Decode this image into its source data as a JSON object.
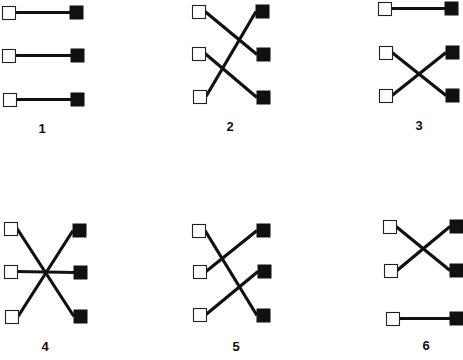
{
  "figure": {
    "colors": {
      "line": "#111111",
      "open_fill": "#ffffff",
      "filled_fill": "#111111",
      "background": "#ffffff"
    },
    "node_size": 13,
    "panels": [
      {
        "label": "1",
        "label_pos": [
          42,
          133
        ],
        "left": [
          [
            2,
            6
          ],
          [
            2,
            49
          ],
          [
            3,
            93
          ]
        ],
        "right": [
          [
            70,
            6
          ],
          [
            71,
            49
          ],
          [
            71,
            93
          ]
        ],
        "pairs": [
          [
            0,
            0
          ],
          [
            1,
            1
          ],
          [
            2,
            2
          ]
        ]
      },
      {
        "label": "2",
        "label_pos": [
          230,
          131
        ],
        "left": [
          [
            192,
            5
          ],
          [
            192,
            47
          ],
          [
            193,
            90
          ]
        ],
        "right": [
          [
            256,
            5
          ],
          [
            257,
            48
          ],
          [
            257,
            91
          ]
        ],
        "pairs": [
          [
            0,
            1
          ],
          [
            1,
            2
          ],
          [
            2,
            0
          ]
        ]
      },
      {
        "label": "3",
        "label_pos": [
          419,
          130
        ],
        "left": [
          [
            378,
            2
          ],
          [
            379,
            46
          ],
          [
            379,
            89
          ]
        ],
        "right": [
          [
            445,
            2
          ],
          [
            446,
            46
          ],
          [
            446,
            89
          ]
        ],
        "pairs": [
          [
            0,
            0
          ],
          [
            1,
            2
          ],
          [
            2,
            1
          ]
        ]
      },
      {
        "label": "4",
        "label_pos": [
          45,
          351
        ],
        "left": [
          [
            4,
            222
          ],
          [
            4,
            265
          ],
          [
            5,
            310
          ]
        ],
        "right": [
          [
            73,
            224
          ],
          [
            74,
            266
          ],
          [
            74,
            310
          ]
        ],
        "pairs": [
          [
            0,
            2
          ],
          [
            1,
            1
          ],
          [
            2,
            0
          ]
        ]
      },
      {
        "label": "5",
        "label_pos": [
          236,
          351
        ],
        "left": [
          [
            192,
            224
          ],
          [
            193,
            265
          ],
          [
            193,
            308
          ]
        ],
        "right": [
          [
            257,
            224
          ],
          [
            258,
            265
          ],
          [
            257,
            309
          ]
        ],
        "pairs": [
          [
            0,
            2
          ],
          [
            1,
            0
          ],
          [
            2,
            1
          ]
        ]
      },
      {
        "label": "6",
        "label_pos": [
          426,
          350
        ],
        "left": [
          [
            383,
            220
          ],
          [
            384,
            264
          ],
          [
            386,
            312
          ]
        ],
        "right": [
          [
            450,
            220
          ],
          [
            450,
            264
          ],
          [
            450,
            312
          ]
        ],
        "pairs": [
          [
            0,
            1
          ],
          [
            1,
            0
          ],
          [
            2,
            2
          ]
        ]
      }
    ]
  }
}
